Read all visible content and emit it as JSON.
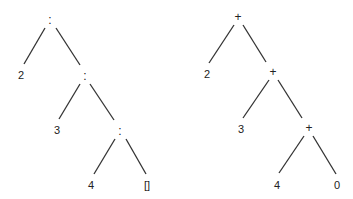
{
  "trees": [
    {
      "name": "cons-list-tree",
      "nodes": [
        {
          "id": "l0",
          "label": ":",
          "x": 50,
          "y": 20
        },
        {
          "id": "l1",
          "label": "2",
          "x": 21,
          "y": 75
        },
        {
          "id": "l2",
          "label": ":",
          "x": 85,
          "y": 76
        },
        {
          "id": "l3",
          "label": "3",
          "x": 57,
          "y": 130
        },
        {
          "id": "l4",
          "label": ":",
          "x": 120,
          "y": 131
        },
        {
          "id": "l5",
          "label": "4",
          "x": 91,
          "y": 185
        },
        {
          "id": "l6",
          "label": "[]",
          "x": 147,
          "y": 185
        }
      ],
      "edges": [
        {
          "from": [
            45,
            28
          ],
          "to": [
            24,
            64
          ]
        },
        {
          "from": [
            56,
            28
          ],
          "to": [
            80,
            65
          ]
        },
        {
          "from": [
            80,
            84
          ],
          "to": [
            59,
            119
          ]
        },
        {
          "from": [
            90,
            84
          ],
          "to": [
            114,
            120
          ]
        },
        {
          "from": [
            115,
            139
          ],
          "to": [
            94,
            174
          ]
        },
        {
          "from": [
            126,
            139
          ],
          "to": [
            146,
            174
          ]
        }
      ]
    },
    {
      "name": "sum-tree",
      "nodes": [
        {
          "id": "r0",
          "label": "+",
          "x": 238,
          "y": 17
        },
        {
          "id": "r1",
          "label": "2",
          "x": 207,
          "y": 74
        },
        {
          "id": "r2",
          "label": "+",
          "x": 273,
          "y": 72
        },
        {
          "id": "r3",
          "label": "3",
          "x": 241,
          "y": 129
        },
        {
          "id": "r4",
          "label": "+",
          "x": 309,
          "y": 128
        },
        {
          "id": "r5",
          "label": "4",
          "x": 277,
          "y": 185
        },
        {
          "id": "r6",
          "label": "0",
          "x": 337,
          "y": 185
        }
      ],
      "edges": [
        {
          "from": [
            234,
            25
          ],
          "to": [
            209,
            63
          ]
        },
        {
          "from": [
            243,
            25
          ],
          "to": [
            266,
            62
          ]
        },
        {
          "from": [
            269,
            80
          ],
          "to": [
            243,
            118
          ]
        },
        {
          "from": [
            278,
            80
          ],
          "to": [
            302,
            118
          ]
        },
        {
          "from": [
            304,
            136
          ],
          "to": [
            279,
            173
          ]
        },
        {
          "from": [
            313,
            136
          ],
          "to": [
            336,
            174
          ]
        }
      ]
    }
  ],
  "colors": {
    "line": "#333333",
    "text": "#222222",
    "background": "#ffffff"
  }
}
